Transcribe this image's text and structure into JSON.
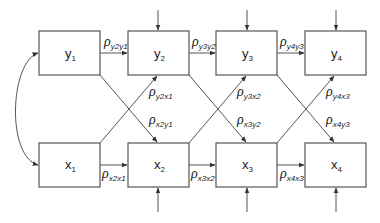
{
  "diagram": {
    "type": "cross-lagged panel path diagram",
    "colors": {
      "stroke": "#555555",
      "text": "#222222",
      "background": "#ffffff"
    },
    "nodes": [
      {
        "id": "y1",
        "base": "y",
        "sub": "1",
        "x": 39,
        "y": 31
      },
      {
        "id": "y2",
        "base": "y",
        "sub": "2",
        "x": 128,
        "y": 31
      },
      {
        "id": "y3",
        "base": "y",
        "sub": "3",
        "x": 216,
        "y": 31
      },
      {
        "id": "y4",
        "base": "y",
        "sub": "4",
        "x": 305,
        "y": 31
      },
      {
        "id": "x1",
        "base": "x",
        "sub": "1",
        "x": 39,
        "y": 143
      },
      {
        "id": "x2",
        "base": "x",
        "sub": "2",
        "x": 128,
        "y": 143
      },
      {
        "id": "x3",
        "base": "x",
        "sub": "3",
        "x": 216,
        "y": 143
      },
      {
        "id": "x4",
        "base": "x",
        "sub": "4",
        "x": 305,
        "y": 143
      }
    ],
    "autoregressive_paths": [
      {
        "from": "y1",
        "to": "y2",
        "symbol": "ρ",
        "sub": "y2y1"
      },
      {
        "from": "y2",
        "to": "y3",
        "symbol": "ρ",
        "sub": "y3y2"
      },
      {
        "from": "y3",
        "to": "y4",
        "symbol": "ρ",
        "sub": "y4y3"
      },
      {
        "from": "x1",
        "to": "x2",
        "symbol": "ρ",
        "sub": "x2x1"
      },
      {
        "from": "x2",
        "to": "x3",
        "symbol": "ρ",
        "sub": "x3x2"
      },
      {
        "from": "x3",
        "to": "x4",
        "symbol": "ρ",
        "sub": "x4x3"
      }
    ],
    "cross_lagged_paths": [
      {
        "from": "x1",
        "to": "y2",
        "symbol": "ρ",
        "sub": "y2x1"
      },
      {
        "from": "y1",
        "to": "x2",
        "symbol": "ρ",
        "sub": "x2y1"
      },
      {
        "from": "x2",
        "to": "y3",
        "symbol": "ρ",
        "sub": "y3x2"
      },
      {
        "from": "y2",
        "to": "x3",
        "symbol": "ρ",
        "sub": "x3y2"
      },
      {
        "from": "x3",
        "to": "y4",
        "symbol": "ρ",
        "sub": "y4x3"
      },
      {
        "from": "y3",
        "to": "x4",
        "symbol": "ρ",
        "sub": "x4y3"
      }
    ],
    "correlation": {
      "between": [
        "y1",
        "x1"
      ],
      "style": "curved double-headed arrow"
    },
    "disturbances": [
      "y2",
      "y3",
      "y4",
      "x2",
      "x3",
      "x4"
    ]
  }
}
